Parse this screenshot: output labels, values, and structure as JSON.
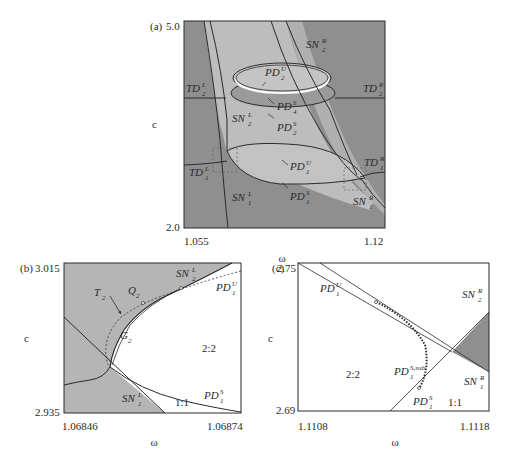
{
  "figure": {
    "panels": [
      {
        "id": "a",
        "panel_label": "(a)",
        "xlabel": "ω",
        "ylabel": "c",
        "x_ticks": [
          "1.055",
          "1.12"
        ],
        "y_ticks": [
          "5.0",
          "2.0"
        ],
        "curve_labels": {
          "SN2R": {
            "base": "SN",
            "sup": "R",
            "sub": "2"
          },
          "PD2U": {
            "base": "PD",
            "sup": "U",
            "sub": "2"
          },
          "TD2L": {
            "base": "TD",
            "sup": "L",
            "sub": "2"
          },
          "TD2R": {
            "base": "TD",
            "sup": "R",
            "sub": "2"
          },
          "PD4S": {
            "base": "PD",
            "sup": "S",
            "sub": "4"
          },
          "SN2L": {
            "base": "SN",
            "sup": "L",
            "sub": "2"
          },
          "PD2S": {
            "base": "PD",
            "sup": "S",
            "sub": "2"
          },
          "TD1R": {
            "base": "TD",
            "sup": "R",
            "sub": "1"
          },
          "TD1L": {
            "base": "TD",
            "sup": "L",
            "sub": "1"
          },
          "PD1U": {
            "base": "PD",
            "sup": "U",
            "sub": "1"
          },
          "SN1L": {
            "base": "SN",
            "sup": "L",
            "sub": "1"
          },
          "PD1S": {
            "base": "PD",
            "sup": "S",
            "sub": "1"
          },
          "SN1R": {
            "base": "SN",
            "sup": "R",
            "sub": "1"
          }
        }
      },
      {
        "id": "b",
        "panel_label": "(b)",
        "xlabel": "ω",
        "ylabel": "c",
        "x_ticks": [
          "1.06846",
          "1.06874"
        ],
        "y_ticks": [
          "3.015",
          "2.935"
        ],
        "curve_labels": {
          "SN2L": {
            "base": "SN",
            "sup": "L",
            "sub": "2"
          },
          "PD1U": {
            "base": "PD",
            "sup": "U",
            "sub": "1"
          },
          "T2": {
            "base": "T",
            "sup": "",
            "sub": "2"
          },
          "Q2": {
            "base": "Q",
            "sup": "",
            "sub": "2"
          },
          "G2": {
            "base": "G",
            "sup": "",
            "sub": "2"
          },
          "SN1L": {
            "base": "SN",
            "sup": "L",
            "sub": "1"
          },
          "PD1S": {
            "base": "PD",
            "sup": "S",
            "sub": "1"
          }
        },
        "region_labels": [
          "2:2",
          "1:1"
        ]
      },
      {
        "id": "c",
        "panel_label": "(c)",
        "xlabel": "ω",
        "ylabel": "c",
        "x_ticks": [
          "1.1108",
          "1.1118"
        ],
        "y_ticks": [
          "2.75",
          "2.69"
        ],
        "curve_labels": {
          "PD1U": {
            "base": "PD",
            "sup": "U",
            "sub": "1"
          },
          "SN2R": {
            "base": "SN",
            "sup": "R",
            "sub": "2"
          },
          "PD1Ssub": {
            "base": "PD",
            "sup": "S,sub",
            "sub": "1"
          },
          "SN1R": {
            "base": "SN",
            "sup": "R",
            "sub": "1"
          },
          "PD1S": {
            "base": "PD",
            "sup": "S",
            "sub": "1"
          }
        },
        "region_labels": [
          "2:2",
          "1:1"
        ]
      }
    ],
    "colors": {
      "dark_region": "#8f8f8f",
      "light_region": "#bdbdbd",
      "mid_region": "#a6a6a6",
      "white_region": "#ffffff",
      "curve": "#2b2b2b"
    }
  }
}
